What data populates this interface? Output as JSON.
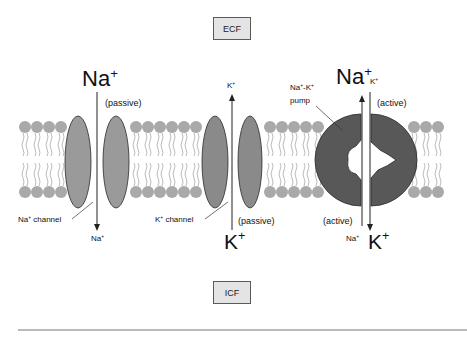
{
  "compartments": {
    "top": "ECF",
    "bottom": "ICF"
  },
  "labels": {
    "na_top_big": {
      "base": "Na",
      "sup": "+"
    },
    "na_passive": "(passive)",
    "na_channel": {
      "base": "Na",
      "sup": "+",
      "suffix": " channel"
    },
    "na_bottom_small": {
      "base": "Na",
      "sup": "+"
    },
    "k_top_small": {
      "base": "K",
      "sup": "+"
    },
    "k_channel": {
      "base": "K",
      "sup": "+",
      "suffix": " channel"
    },
    "k_passive": "(passive)",
    "k_bottom_big": {
      "base": "K",
      "sup": "+"
    },
    "pump_name_line1": {
      "a": "Na",
      "sup1": "+",
      "b": "-K",
      "sup2": "+"
    },
    "pump_name_line2": "pump",
    "pump_na_top_big": {
      "base": "Na",
      "sup": "+"
    },
    "pump_k_top_small": {
      "base": "K",
      "sup": "+"
    },
    "pump_active_top": "(active)",
    "pump_active_bottom": "(active)",
    "pump_na_bottom_small": {
      "base": "Na",
      "sup": "+"
    },
    "pump_k_bottom_big": {
      "base": "K",
      "sup": "+"
    }
  },
  "colors": {
    "lipid_head": "#a9a9a9",
    "lipid_tail": "#b3b3b3",
    "channel_fill": "#9a9a9a",
    "k_channel_fill": "#8a8a8a",
    "pump_fill": "#585858",
    "outline": "#2a2a2a",
    "box_fill": "#e4e4e4",
    "rule": "#777777"
  }
}
